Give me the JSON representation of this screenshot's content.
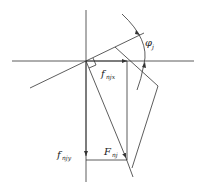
{
  "diagram": {
    "type": "force-decomposition",
    "colors": {
      "line": "#333333",
      "background": "#ffffff"
    },
    "labels": {
      "angle": {
        "main": "φ",
        "sub": "j"
      },
      "fx": {
        "main": "f",
        "sub": "njx"
      },
      "fy": {
        "main": "f",
        "sub": "njy"
      },
      "F": {
        "main": "F",
        "sub": "nj"
      }
    },
    "elements": [
      "horizontal-axis",
      "vertical-axis",
      "inclined-line",
      "force-vector-F",
      "component-x-arrow",
      "component-y-arrow",
      "right-angle-marker",
      "angle-arc",
      "tool-outline"
    ]
  }
}
